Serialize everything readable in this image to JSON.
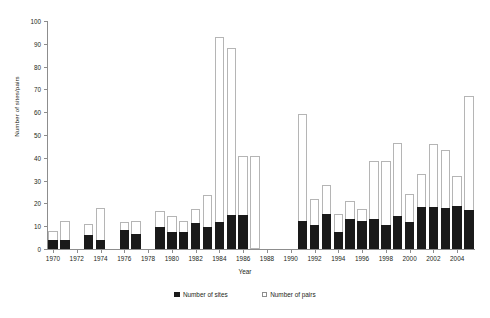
{
  "chart_data": {
    "type": "bar",
    "title": "",
    "xlabel": "Year",
    "ylabel": "Number of sites/pairs",
    "stacked_style": "overlaid",
    "grid": false,
    "legend_position": "bottom",
    "ylim": [
      0,
      100
    ],
    "ytick_step": 10,
    "yticks": [
      0,
      10,
      20,
      30,
      40,
      50,
      60,
      70,
      80,
      90,
      100
    ],
    "xlim": [
      1969.5,
      2005.5
    ],
    "xtick_labels": [
      "1970",
      "1972",
      "1974",
      "1976",
      "1978",
      "1980",
      "1982",
      "1984",
      "1986",
      "1988",
      "1990",
      "1992",
      "1994",
      "1996",
      "1998",
      "2000",
      "2002",
      "2004"
    ],
    "categories": [
      1970,
      1971,
      1972,
      1973,
      1974,
      1975,
      1976,
      1977,
      1978,
      1979,
      1980,
      1981,
      1982,
      1983,
      1984,
      1985,
      1986,
      1987,
      1988,
      1989,
      1990,
      1991,
      1992,
      1993,
      1994,
      1995,
      1996,
      1997,
      1998,
      1999,
      2000,
      2001,
      2002,
      2003,
      2004,
      2005
    ],
    "series": [
      {
        "name": "Number of sites",
        "color": "#1a1a1a",
        "values": [
          4,
          4,
          0,
          6,
          4,
          0,
          8.5,
          6.5,
          0,
          9.5,
          7.5,
          7.5,
          11.5,
          9.5,
          12,
          15,
          15,
          0,
          0,
          0,
          0,
          12.5,
          10.5,
          15.5,
          7.5,
          13,
          12.5,
          13,
          10.5,
          14.5,
          12,
          18.5,
          18.5,
          18,
          19,
          17
        ]
      },
      {
        "name": "Number of pairs",
        "color": "#ffffff",
        "values": [
          8,
          12.5,
          0,
          11,
          18,
          0,
          12,
          12.5,
          0,
          16.5,
          14.5,
          12.5,
          17.5,
          23.5,
          93,
          88,
          41,
          41,
          0,
          0,
          0,
          59,
          22,
          28,
          15.5,
          21,
          17.5,
          38.5,
          38.5,
          46.5,
          24,
          33,
          46,
          43.5,
          32,
          67
        ]
      }
    ]
  },
  "legend": {
    "items": [
      {
        "label": "Number of sites"
      },
      {
        "label": "Number of pairs"
      }
    ]
  }
}
